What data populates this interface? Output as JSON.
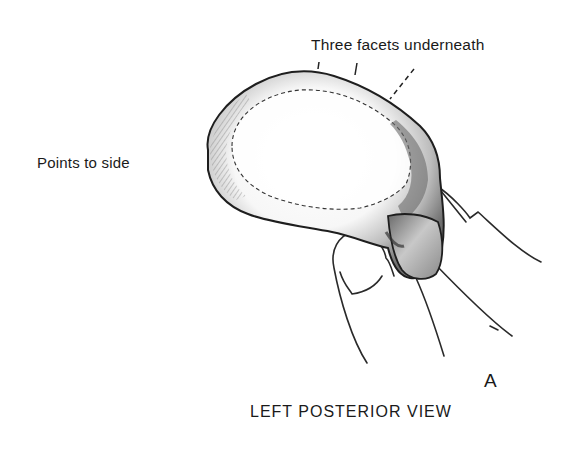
{
  "figure": {
    "panel_letter": "A",
    "caption": "LEFT POSTERIOR VIEW"
  },
  "annotations": {
    "facets": "Three facets underneath",
    "side": "Points to side"
  },
  "colors": {
    "ink": "#1a1a1a",
    "shade_dark": "#555555",
    "shade_mid": "#9a9a9a",
    "paper": "#ffffff"
  }
}
